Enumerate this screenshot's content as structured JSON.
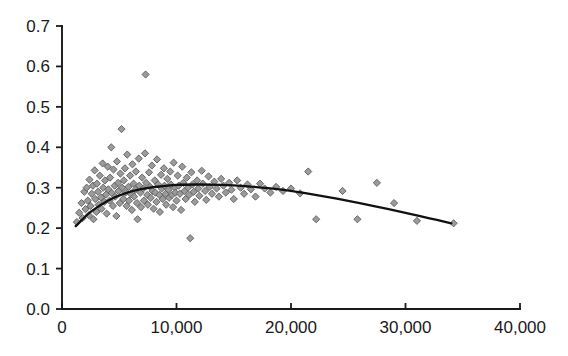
{
  "chart_data": {
    "type": "scatter",
    "title": "",
    "subtitle": "",
    "xlabel": "",
    "ylabel": "",
    "xlim": [
      0,
      40000
    ],
    "ylim": [
      0.0,
      0.7
    ],
    "grid": false,
    "legend": null,
    "legend_position": "none",
    "xticks": [
      0,
      10000,
      20000,
      30000,
      40000
    ],
    "xtick_labels": [
      "0",
      "10,000",
      "20,000",
      "30,000",
      "40,000"
    ],
    "yticks": [
      0.0,
      0.1,
      0.2,
      0.3,
      0.4,
      0.5,
      0.6,
      0.7
    ],
    "ytick_labels": [
      "0.0",
      "0.1",
      "0.2",
      "0.3",
      "0.4",
      "0.5",
      "0.6",
      "0.7"
    ],
    "marker": {
      "shape": "diamond",
      "fill_color": "#9b9b9b",
      "edge_color": "#5d5d5d",
      "size_px": 6
    },
    "series": [
      {
        "name": "observations",
        "type": "scatter",
        "points": [
          [
            1300,
            0.215
          ],
          [
            1500,
            0.238
          ],
          [
            1700,
            0.262
          ],
          [
            1800,
            0.225
          ],
          [
            1950,
            0.29
          ],
          [
            2050,
            0.247
          ],
          [
            2150,
            0.3
          ],
          [
            2250,
            0.268
          ],
          [
            2350,
            0.232
          ],
          [
            2400,
            0.32
          ],
          [
            2500,
            0.255
          ],
          [
            2600,
            0.285
          ],
          [
            2700,
            0.305
          ],
          [
            2750,
            0.222
          ],
          [
            2850,
            0.343
          ],
          [
            2900,
            0.272
          ],
          [
            3000,
            0.24
          ],
          [
            3050,
            0.31
          ],
          [
            3150,
            0.29
          ],
          [
            3200,
            0.258
          ],
          [
            3300,
            0.33
          ],
          [
            3400,
            0.276
          ],
          [
            3450,
            0.248
          ],
          [
            3550,
            0.36
          ],
          [
            3600,
            0.3
          ],
          [
            3700,
            0.265
          ],
          [
            3750,
            0.318
          ],
          [
            3850,
            0.283
          ],
          [
            3900,
            0.236
          ],
          [
            4000,
            0.352
          ],
          [
            4050,
            0.296
          ],
          [
            4150,
            0.268
          ],
          [
            4200,
            0.325
          ],
          [
            4300,
            0.4
          ],
          [
            4350,
            0.287
          ],
          [
            4450,
            0.255
          ],
          [
            4500,
            0.345
          ],
          [
            4600,
            0.305
          ],
          [
            4650,
            0.278
          ],
          [
            4750,
            0.23
          ],
          [
            4800,
            0.365
          ],
          [
            4900,
            0.312
          ],
          [
            4950,
            0.292
          ],
          [
            5050,
            0.262
          ],
          [
            5100,
            0.335
          ],
          [
            5200,
            0.445
          ],
          [
            5250,
            0.3
          ],
          [
            5350,
            0.272
          ],
          [
            5400,
            0.318
          ],
          [
            5500,
            0.348
          ],
          [
            5550,
            0.288
          ],
          [
            5650,
            0.255
          ],
          [
            5700,
            0.382
          ],
          [
            5800,
            0.302
          ],
          [
            5850,
            0.268
          ],
          [
            5950,
            0.33
          ],
          [
            6000,
            0.285
          ],
          [
            6100,
            0.245
          ],
          [
            6150,
            0.358
          ],
          [
            6250,
            0.31
          ],
          [
            6300,
            0.278
          ],
          [
            6400,
            0.295
          ],
          [
            6450,
            0.34
          ],
          [
            6550,
            0.262
          ],
          [
            6600,
            0.222
          ],
          [
            6700,
            0.372
          ],
          [
            6750,
            0.305
          ],
          [
            6850,
            0.288
          ],
          [
            6900,
            0.252
          ],
          [
            7000,
            0.325
          ],
          [
            7100,
            0.298
          ],
          [
            7150,
            0.268
          ],
          [
            7250,
            0.385
          ],
          [
            7300,
            0.58
          ],
          [
            7350,
            0.312
          ],
          [
            7450,
            0.282
          ],
          [
            7500,
            0.258
          ],
          [
            7600,
            0.338
          ],
          [
            7700,
            0.302
          ],
          [
            7750,
            0.275
          ],
          [
            7850,
            0.355
          ],
          [
            7900,
            0.292
          ],
          [
            8000,
            0.248
          ],
          [
            8100,
            0.318
          ],
          [
            8150,
            0.288
          ],
          [
            8250,
            0.265
          ],
          [
            8300,
            0.37
          ],
          [
            8400,
            0.308
          ],
          [
            8500,
            0.282
          ],
          [
            8550,
            0.24
          ],
          [
            8650,
            0.332
          ],
          [
            8700,
            0.298
          ],
          [
            8800,
            0.272
          ],
          [
            8900,
            0.348
          ],
          [
            8950,
            0.305
          ],
          [
            9050,
            0.285
          ],
          [
            9100,
            0.258
          ],
          [
            9200,
            0.322
          ],
          [
            9300,
            0.295
          ],
          [
            9350,
            0.275
          ],
          [
            9450,
            0.34
          ],
          [
            9500,
            0.308
          ],
          [
            9600,
            0.282
          ],
          [
            9700,
            0.252
          ],
          [
            9750,
            0.362
          ],
          [
            9850,
            0.3
          ],
          [
            9900,
            0.288
          ],
          [
            10000,
            0.268
          ],
          [
            10100,
            0.33
          ],
          [
            10200,
            0.305
          ],
          [
            10300,
            0.285
          ],
          [
            10400,
            0.245
          ],
          [
            10500,
            0.352
          ],
          [
            10600,
            0.312
          ],
          [
            10700,
            0.292
          ],
          [
            10800,
            0.272
          ],
          [
            10900,
            0.325
          ],
          [
            11000,
            0.3
          ],
          [
            11100,
            0.282
          ],
          [
            11200,
            0.175
          ],
          [
            11300,
            0.338
          ],
          [
            11400,
            0.308
          ],
          [
            11500,
            0.29
          ],
          [
            11600,
            0.265
          ],
          [
            11800,
            0.318
          ],
          [
            11900,
            0.298
          ],
          [
            12000,
            0.28
          ],
          [
            12200,
            0.342
          ],
          [
            12300,
            0.31
          ],
          [
            12500,
            0.292
          ],
          [
            12600,
            0.27
          ],
          [
            12800,
            0.328
          ],
          [
            12900,
            0.302
          ],
          [
            13100,
            0.285
          ],
          [
            13300,
            0.315
          ],
          [
            13500,
            0.298
          ],
          [
            13700,
            0.278
          ],
          [
            13900,
            0.322
          ],
          [
            14100,
            0.305
          ],
          [
            14300,
            0.288
          ],
          [
            14600,
            0.312
          ],
          [
            14800,
            0.295
          ],
          [
            15000,
            0.272
          ],
          [
            15300,
            0.318
          ],
          [
            15600,
            0.3
          ],
          [
            15900,
            0.285
          ],
          [
            16200,
            0.308
          ],
          [
            16500,
            0.296
          ],
          [
            16900,
            0.278
          ],
          [
            17300,
            0.31
          ],
          [
            17700,
            0.298
          ],
          [
            18200,
            0.288
          ],
          [
            18700,
            0.302
          ],
          [
            19300,
            0.292
          ],
          [
            20000,
            0.298
          ],
          [
            20800,
            0.286
          ],
          [
            21500,
            0.34
          ],
          [
            22200,
            0.222
          ],
          [
            24500,
            0.292
          ],
          [
            25800,
            0.222
          ],
          [
            27500,
            0.312
          ],
          [
            29000,
            0.262
          ],
          [
            31000,
            0.218
          ],
          [
            34200,
            0.212
          ]
        ]
      },
      {
        "name": "fitted-curve",
        "type": "line",
        "color": "#111111",
        "points": [
          [
            1200,
            0.205
          ],
          [
            2500,
            0.24
          ],
          [
            4000,
            0.268
          ],
          [
            5500,
            0.286
          ],
          [
            7000,
            0.297
          ],
          [
            8500,
            0.303
          ],
          [
            10000,
            0.307
          ],
          [
            12000,
            0.308
          ],
          [
            14000,
            0.307
          ],
          [
            16000,
            0.304
          ],
          [
            18000,
            0.299
          ],
          [
            20000,
            0.292
          ],
          [
            22000,
            0.283
          ],
          [
            24000,
            0.273
          ],
          [
            26000,
            0.262
          ],
          [
            28000,
            0.25
          ],
          [
            30000,
            0.238
          ],
          [
            32000,
            0.225
          ],
          [
            34000,
            0.212
          ]
        ]
      }
    ],
    "annotations": [
      {
        "text": "outlier",
        "x": 7300,
        "y": 0.58
      }
    ]
  },
  "axes": {
    "x_axis_name": "x-axis",
    "y_axis_name": "y-axis",
    "spine_color": "#1a1a1a"
  }
}
